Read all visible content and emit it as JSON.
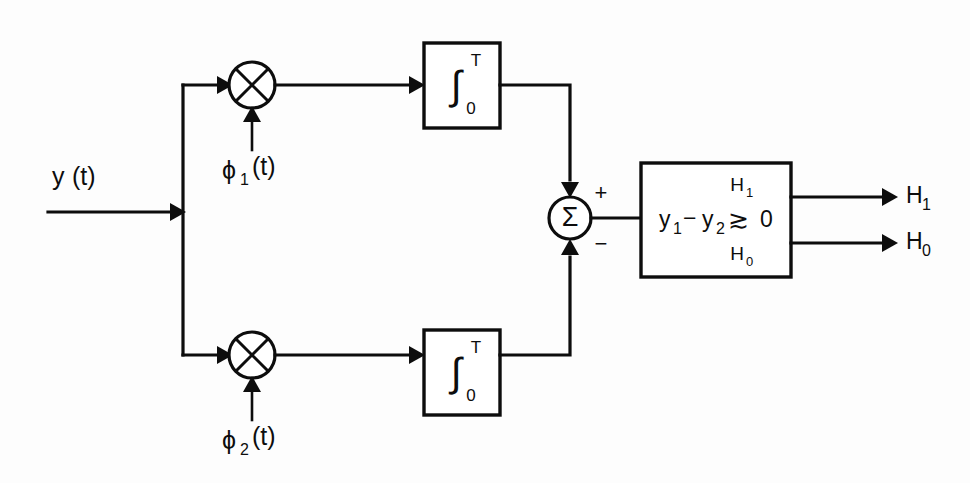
{
  "diagram": {
    "background_color": "#fdfdfd",
    "line_color": "#0d0d0d",
    "input": {
      "label_base": "y",
      "label_arg": "(t)",
      "full": "y (t)"
    },
    "branches": [
      {
        "id": "upper",
        "multiplier": {
          "symbol": "x",
          "shape": "circle-with-cross"
        },
        "reference": {
          "base": "ϕ",
          "subscript": "1",
          "arg": "(t)",
          "full": "ϕ₁(t)"
        },
        "integrator": {
          "symbol": "∫",
          "upper_limit": "T",
          "lower_limit": "0"
        },
        "summer_port_sign": "+"
      },
      {
        "id": "lower",
        "multiplier": {
          "symbol": "x",
          "shape": "circle-with-cross"
        },
        "reference": {
          "base": "ϕ",
          "subscript": "2",
          "arg": "(t)",
          "full": "ϕ₂(t)"
        },
        "integrator": {
          "symbol": "∫",
          "upper_limit": "T",
          "lower_limit": "0"
        },
        "summer_port_sign": "−"
      }
    ],
    "summer": {
      "symbol": "Σ",
      "plus_sign": "+",
      "minus_sign": "−"
    },
    "decision_block": {
      "expression_left": "y",
      "expression_left_sub": "1",
      "expression_minus": "−",
      "expression_right": "y",
      "expression_right_sub": "2",
      "expression_full": "y₁ − y₂",
      "comparator": "≳",
      "hypothesis_above": "H",
      "hypothesis_above_sub": "1",
      "hypothesis_below": "H",
      "hypothesis_below_sub": "0",
      "threshold": "0"
    },
    "outputs": [
      {
        "base": "H",
        "subscript": "1",
        "full": "H₁"
      },
      {
        "base": "H",
        "subscript": "0",
        "full": "H₀"
      }
    ]
  }
}
